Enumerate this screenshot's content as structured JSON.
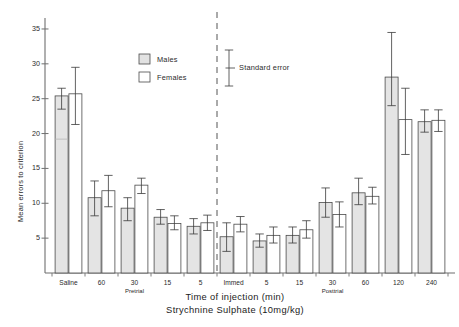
{
  "chart_data": {
    "type": "bar",
    "title": "",
    "xlabel": "Time of injection (min)",
    "sublabel": "Strychnine Sulphate (10mg/kg)",
    "ylabel": "Mean errors to criterion",
    "ylim": [
      0,
      36
    ],
    "yticks": [
      5,
      10,
      15,
      20,
      25,
      30,
      35
    ],
    "ytick_labels": [
      "5",
      "10",
      "15",
      "20",
      "25",
      "30",
      "35"
    ],
    "grid": false,
    "legend_position": "upper-center",
    "legend": [
      {
        "name": "Males",
        "fill": "#e2e2e2"
      },
      {
        "name": "Females",
        "fill": "#ffffff"
      }
    ],
    "error_legend": {
      "label": "Standard error"
    },
    "divider": {
      "style": "dashed",
      "after_category": "5"
    },
    "group_labels": [
      {
        "label": "Pretrial",
        "under": "30"
      },
      {
        "label": "Posttrial",
        "under": "30 "
      }
    ],
    "categories": [
      "Saline",
      "60",
      "30",
      "15",
      "5",
      "Immed",
      "5 ",
      "15 ",
      "30 ",
      "60 ",
      "120",
      "240"
    ],
    "category_labels": [
      "Saline",
      "60",
      "30",
      "15",
      "5",
      "Immed",
      "5",
      "15",
      "30",
      "60",
      "120",
      "240"
    ],
    "series": [
      {
        "name": "Males",
        "values": [
          25.4,
          10.8,
          9.3,
          8.0,
          6.7,
          5.2,
          4.6,
          5.4,
          10.1,
          11.5,
          28.1,
          21.7
        ],
        "err_low": [
          23.5,
          8.2,
          7.5,
          7.0,
          5.6,
          3.1,
          3.7,
          4.3,
          8.0,
          9.8,
          24.0,
          20.2
        ],
        "err_high": [
          26.5,
          13.2,
          10.8,
          9.1,
          7.8,
          7.2,
          5.6,
          6.6,
          12.2,
          13.6,
          34.5,
          23.4
        ]
      },
      {
        "name": "Females",
        "values": [
          25.7,
          11.8,
          12.6,
          7.1,
          7.2,
          7.0,
          5.4,
          6.2,
          8.4,
          11.0,
          22.0,
          21.9
        ],
        "err_low": [
          21.3,
          9.5,
          11.4,
          6.2,
          6.1,
          5.9,
          4.3,
          5.0,
          6.6,
          9.9,
          17.0,
          20.3
        ],
        "err_high": [
          29.5,
          14.0,
          13.6,
          8.2,
          8.3,
          8.1,
          6.6,
          7.5,
          10.2,
          12.3,
          26.5,
          23.4
        ]
      }
    ]
  }
}
